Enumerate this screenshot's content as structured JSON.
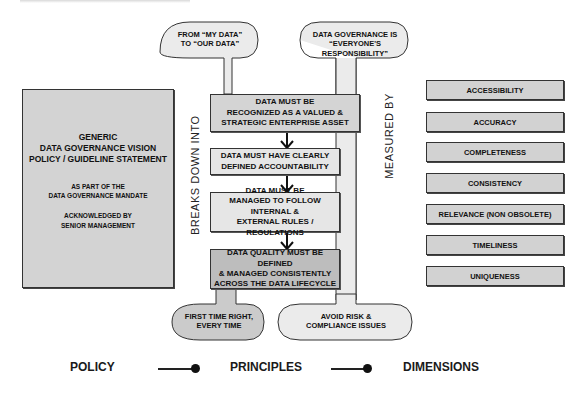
{
  "top_bubbles": {
    "left": [
      "FROM “MY DATA”",
      "TO “OUR DATA”"
    ],
    "right": [
      "DATA GOVERNANCE IS",
      "“EVERYONE'S RESPONSIBILITY”"
    ]
  },
  "bottom_bubbles": {
    "left": [
      "FIRST TIME RIGHT,",
      "EVERY TIME"
    ],
    "right": [
      "AVOID RISK &",
      "COMPLIANCE ISSUES"
    ]
  },
  "policy_box": {
    "title_lines": [
      "GENERIC",
      "DATA GOVERNANCE VISION",
      "POLICY / GUIDELINE STATEMENT"
    ],
    "mandate_lines": [
      "AS PART OF THE",
      "DATA GOVERNANCE MANDATE"
    ],
    "ack_lines": [
      "ACKNOWLEDGED BY",
      "SENIOR MANAGEMENT"
    ]
  },
  "principles": [
    [
      "DATA MUST BE",
      "RECOGNIZED AS A VALUED &",
      "STRATEGIC ENTERPRISE ASSET"
    ],
    [
      "DATA MUST HAVE CLEARLY",
      "DEFINED ACCOUNTABILITY"
    ],
    [
      "DATA MUST BE",
      "MANAGED TO FOLLOW INTERNAL &",
      "EXTERNAL RULES / REGULATIONS"
    ],
    [
      "DATA QUALITY MUST BE DEFINED",
      "& MANAGED CONSISTENTLY",
      "ACROSS THE DATA LIFECYCLE"
    ]
  ],
  "vertical_labels": {
    "breaks_down": "BREAKS DOWN INTO",
    "measured_by": "MEASURED BY"
  },
  "dimensions": [
    "ACCESSIBILITY",
    "ACCURACY",
    "COMPLETENESS",
    "CONSISTENCY",
    "RELEVANCE (NON OBSOLETE)",
    "TIMELINESS",
    "UNIQUENESS"
  ],
  "legend": {
    "policy": "POLICY",
    "principles": "PRINCIPLES",
    "dimensions": "DIMENSIONS"
  },
  "colors": {
    "box_fill": "#d4d4d4",
    "bubble_fill_light": "#ececec",
    "bubble_fill_dark": "#c9c9c9",
    "stroke": "#333333"
  }
}
